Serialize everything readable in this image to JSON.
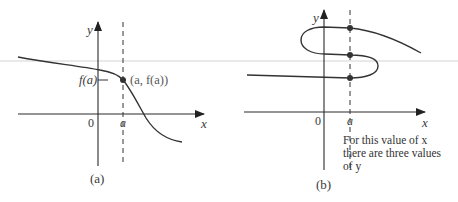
{
  "panel_a": {
    "caption": "(a)",
    "x_axis_label": "x",
    "y_axis_label": "y",
    "origin_label": "0",
    "x_tick_label": "a",
    "y_tick_label": "f(a)",
    "point_label": "(a, f(a))"
  },
  "panel_b": {
    "caption": "(b)",
    "x_axis_label": "x",
    "y_axis_label": "y",
    "origin_label": "0",
    "x_tick_label": "a",
    "note_line1": "For this value of x",
    "note_line2": "there are three values",
    "note_line3": "of y"
  },
  "colors": {
    "curve": "#333333",
    "axis": "#2a2a2a",
    "text": "#3a3a3a"
  }
}
